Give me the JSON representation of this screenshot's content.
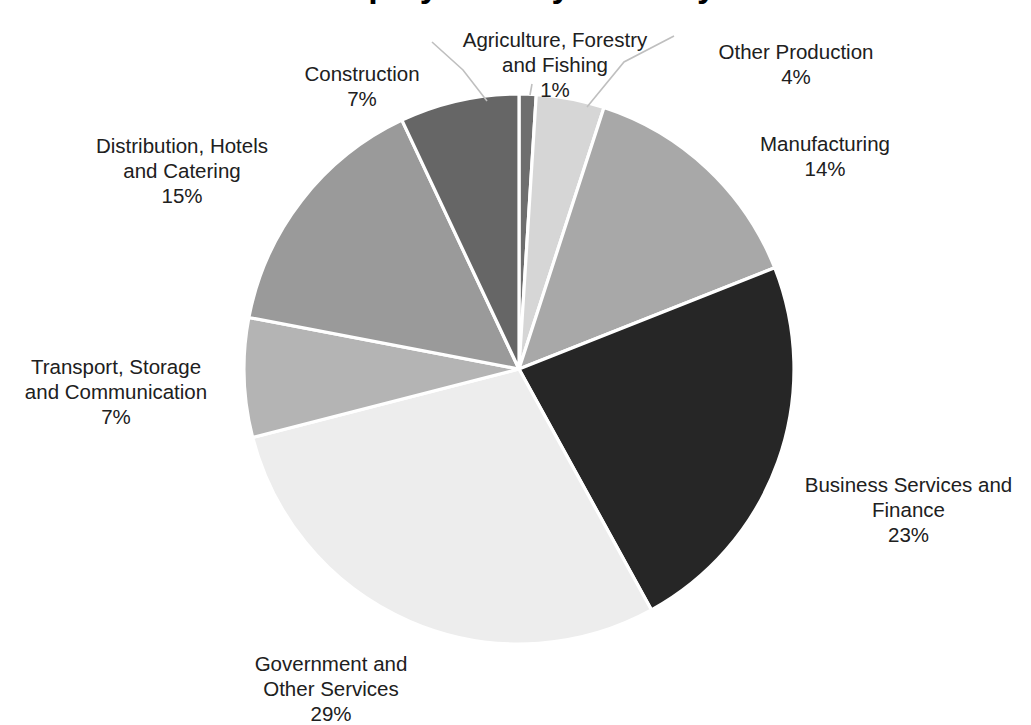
{
  "title_fragment": "Employment by Industry",
  "chart_data": {
    "type": "pie",
    "title": "Employment by Industry",
    "xlabel": "",
    "ylabel": "",
    "legend_position": "none",
    "labels_position": "outside-with-leader-lines",
    "start_angle_deg": 0,
    "direction": "clockwise",
    "center": {
      "x": 519,
      "y": 369
    },
    "radius": 275,
    "separator_color": "#ffffff",
    "categories": [
      "Agriculture, Forestry and Fishing",
      "Other Production",
      "Manufacturing",
      "Business Services and Finance",
      "Government and Other Services",
      "Transport, Storage and Communication",
      "Distribution, Hotels and Catering",
      "Construction"
    ],
    "values": [
      1,
      4,
      14,
      23,
      29,
      7,
      15,
      7
    ],
    "value_labels": [
      "1%",
      "4%",
      "14%",
      "23%",
      "29%",
      "7%",
      "15%",
      "7%"
    ],
    "colors": [
      "#6e6e6e",
      "#d6d6d6",
      "#a8a8a8",
      "#262626",
      "#ededed",
      "#b4b4b4",
      "#9a9a9a",
      "#666666"
    ],
    "total": 100,
    "units": "percent"
  },
  "slices": [
    {
      "key": "agriculture",
      "name": "Agriculture, Forestry and Fishing",
      "label_lines": "Agriculture, Forestry\nand Fishing",
      "percent_label": "1%",
      "value": 1,
      "color": "#6e6e6e"
    },
    {
      "key": "other-production",
      "name": "Other Production",
      "label_lines": "Other Production",
      "percent_label": "4%",
      "value": 4,
      "color": "#d6d6d6"
    },
    {
      "key": "manufacturing",
      "name": "Manufacturing",
      "label_lines": "Manufacturing",
      "percent_label": "14%",
      "value": 14,
      "color": "#a8a8a8"
    },
    {
      "key": "business-services-and-finance",
      "name": "Business Services and Finance",
      "label_lines": "Business Services and\nFinance",
      "percent_label": "23%",
      "value": 23,
      "color": "#262626"
    },
    {
      "key": "government-and-other-services",
      "name": "Government and Other Services",
      "label_lines": "Government and\nOther Services",
      "percent_label": "29%",
      "value": 29,
      "color": "#ededed"
    },
    {
      "key": "transport-storage-and-communication",
      "name": "Transport, Storage and Communication",
      "label_lines": "Transport, Storage\nand Communication",
      "percent_label": "7%",
      "value": 7,
      "color": "#b4b4b4"
    },
    {
      "key": "distribution-hotels-and-catering",
      "name": "Distribution, Hotels and Catering",
      "label_lines": "Distribution, Hotels\nand Catering",
      "percent_label": "15%",
      "value": 15,
      "color": "#9a9a9a"
    },
    {
      "key": "construction",
      "name": "Construction",
      "label_lines": "Construction",
      "percent_label": "7%",
      "value": 7,
      "color": "#666666"
    }
  ]
}
